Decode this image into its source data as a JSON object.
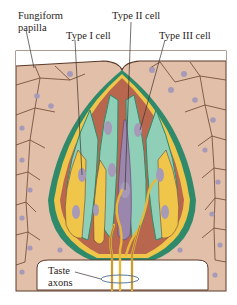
{
  "labels": {
    "fungiform_line1": "Fungiform",
    "fungiform_line2": "papilla",
    "type1": "Type I cell",
    "type2": "Type II cell",
    "type3": "Type III cell",
    "taste_line1": "Taste",
    "taste_line2": "axons"
  },
  "colors": {
    "epithelium": "#e2bfa8",
    "epithelium_line": "#5a3a2a",
    "nucleus": "#a79ab8",
    "type1_yellow": "#f0c64a",
    "type2_teal": "#8fcfb8",
    "type3_purple": "#9b86ad",
    "support_brown": "#b8674e",
    "green_border": "#2e8a6a",
    "axon": "#e8b83a"
  }
}
